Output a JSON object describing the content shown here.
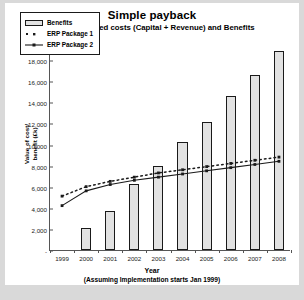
{
  "chart_data": {
    "type": "bar",
    "title": "Simple payback",
    "subtitle": "Non discounted costs (Capital + Revenue) and Benefits",
    "xlabel": "Year",
    "xsublabel": "(Assuming Implementation starts Jan 1999)",
    "ylabel_line1": "Value of cost/",
    "ylabel_line2": "benefit (£k)",
    "categories": [
      "1999",
      "2000",
      "2001",
      "2002",
      "2003",
      "2004",
      "2005",
      "2006",
      "2007",
      "2008"
    ],
    "ylim": [
      0,
      20000
    ],
    "yticks": [
      0,
      2000,
      4000,
      6000,
      8000,
      10000,
      12000,
      14000,
      16000,
      18000,
      20000
    ],
    "ytick_labels": [
      "-",
      "2,000",
      "4,000",
      "6,000",
      "8,000",
      "10,000",
      "12,000",
      "14,000",
      "16,000",
      "18,000",
      "20,000"
    ],
    "grid": false,
    "legend_position": "top-left",
    "series": [
      {
        "name": "Benefits",
        "type": "bar",
        "color": "#e2e2e2",
        "edge_color": "#1a1a1a",
        "values": [
          0,
          2100,
          3700,
          6300,
          8000,
          10200,
          12100,
          14600,
          16600,
          18900
        ]
      },
      {
        "name": "ERP Package 1",
        "type": "line",
        "style": "dotted",
        "color": "#1a1a1a",
        "values": [
          5200,
          6100,
          6600,
          7000,
          7400,
          7700,
          8000,
          8300,
          8600,
          8900
        ]
      },
      {
        "name": "ERP Package 2",
        "type": "line",
        "style": "solid",
        "color": "#1a1a1a",
        "values": [
          4300,
          5700,
          6300,
          6700,
          7000,
          7300,
          7600,
          7900,
          8200,
          8500
        ]
      }
    ]
  },
  "legend": {
    "items": [
      {
        "label": "Benefits",
        "marker": "bar-swatch"
      },
      {
        "label": "ERP Package 1",
        "marker": "dotted-line-marker"
      },
      {
        "label": "ERP Package 2",
        "marker": "solid-line-marker"
      }
    ]
  }
}
